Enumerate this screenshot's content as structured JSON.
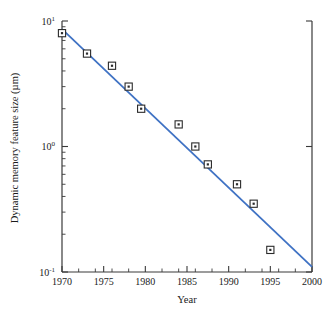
{
  "chart_data": {
    "type": "scatter",
    "title": "",
    "subtitle": "",
    "xlabel": "Year",
    "ylabel": "Dynamic memory feature size (µm)",
    "xlim": [
      1970,
      2000
    ],
    "ylim": [
      0.1,
      10
    ],
    "yscale": "log",
    "xscale": "linear",
    "grid": false,
    "legend": null,
    "x_ticks": [
      1970,
      1975,
      1980,
      1985,
      1990,
      1995,
      2000
    ],
    "x_tick_labels": [
      "1970",
      "1975",
      "1980",
      "1985",
      "1990",
      "1995",
      "2000"
    ],
    "y_ticks": [
      0.1,
      1,
      10
    ],
    "y_tick_labels": [
      "10⁻¹",
      "10⁰",
      "10¹"
    ],
    "y_tick_label_parts": [
      {
        "base": "10",
        "exp": "-1"
      },
      {
        "base": "10",
        "exp": "0"
      },
      {
        "base": "10",
        "exp": "1"
      }
    ],
    "y_minor_ticks": [
      0.2,
      0.3,
      0.4,
      0.5,
      0.6,
      0.7,
      0.8,
      0.9,
      2,
      3,
      4,
      5,
      6,
      7,
      8,
      9
    ],
    "series": [
      {
        "name": "Measured DRAM feature size",
        "type": "scatter",
        "marker": "square-with-center-dot",
        "marker_color": "#2b2b2b",
        "x": [
          1970.0,
          1973.0,
          1976.0,
          1978.0,
          1979.5,
          1984.0,
          1986.0,
          1987.5,
          1991.0,
          1993.0,
          1995.0
        ],
        "y": [
          8.0,
          5.5,
          4.4,
          3.0,
          2.0,
          1.5,
          1.0,
          0.72,
          0.5,
          0.35,
          0.15
        ]
      },
      {
        "name": "Trend line",
        "type": "line",
        "color": "#3f72c4",
        "x": [
          1970.0,
          2000.0
        ],
        "y": [
          8.6,
          0.11
        ]
      }
    ],
    "annotations": []
  },
  "figure": {
    "border_color": "#3a3a3a",
    "top_border_accent_color": "#f08080",
    "background": "#ffffff",
    "axis_label_color": "#1a1a1a"
  }
}
